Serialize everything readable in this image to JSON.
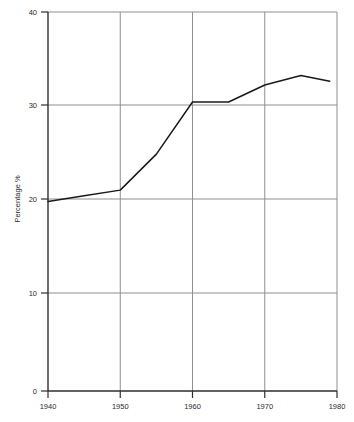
{
  "chart_data": {
    "type": "line",
    "title": "",
    "subtitle": "",
    "xlabel": "",
    "ylabel": "Percentage %",
    "xlim": [
      1940,
      1980
    ],
    "ylim": [
      0,
      40
    ],
    "xticks": [
      1940,
      1950,
      1960,
      1970,
      1980
    ],
    "xtick_labels": [
      "1940",
      "1950",
      "1960",
      "1970",
      "1980"
    ],
    "yticks": [
      0,
      10,
      20,
      30,
      40
    ],
    "ytick_labels": [
      "0",
      "10",
      "20",
      "30",
      "40"
    ],
    "grid": true,
    "grid_axis": "both",
    "legend": false,
    "legend_position": "none",
    "line_color": "#1a1a1a",
    "grid_color": "#9a9a9a",
    "axis_color": "#3a3a3a",
    "background_color": "#ffffff",
    "series": [
      {
        "name": "Percentage",
        "x": [
          1940,
          1945,
          1950,
          1955,
          1960,
          1965,
          1970,
          1975,
          1979
        ],
        "values": [
          20.0,
          20.6,
          21.2,
          25.0,
          30.5,
          30.5,
          32.3,
          33.3,
          32.7
        ]
      }
    ],
    "annotations": []
  },
  "axis_labels": {
    "y_axis_title": "Percentage %",
    "y_tick_40": "40",
    "y_tick_30": "30",
    "y_tick_20": "20",
    "y_tick_10": "10",
    "y_tick_0": "0",
    "x_tick_1940": "1940",
    "x_tick_1950": "1950",
    "x_tick_1960": "1960",
    "x_tick_1970": "1970",
    "x_tick_1980": "1980"
  }
}
